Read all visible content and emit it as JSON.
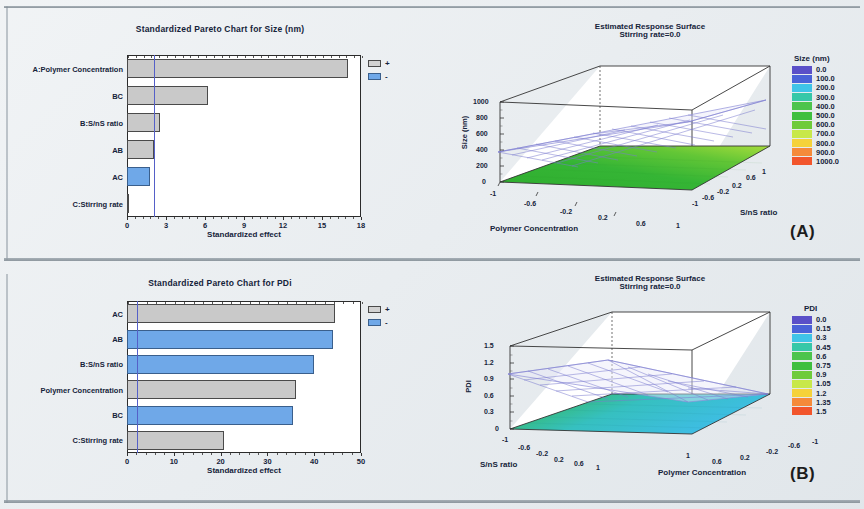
{
  "figure": {
    "panels": [
      {
        "tag": "(A)"
      },
      {
        "tag": "(B)"
      }
    ]
  },
  "panel_a": {
    "tag": "(A)",
    "pareto": {
      "title": "Standardized Pareto Chart for Size (nm)",
      "xtitle": "Standardized effect",
      "legend": {
        "positive": "+",
        "negative": "-"
      }
    },
    "surface": {
      "title_line1": "Estimated Response Surface",
      "title_line2": "Stirring rate=0.0",
      "zlabel": "Size (nm)",
      "xlabel": "Polymer Concentration",
      "ylabel": "S/nS ratio",
      "legend_title": "Size (nm)"
    }
  },
  "panel_b": {
    "tag": "(B)",
    "pareto": {
      "title": "Standardized Pareto Chart for PDi",
      "xtitle": "Standardized effect",
      "legend": {
        "positive": "+",
        "negative": "-"
      }
    },
    "surface": {
      "title_line1": "Estimated Response Surface",
      "title_line2": "Stirring rate=0.0",
      "zlabel": "PDI",
      "xlabel": "Polymer Concentration",
      "ylabel": "S/nS ratio",
      "legend_title": "PDI"
    }
  },
  "chart_data": [
    {
      "type": "bar",
      "id": "pareto-size",
      "orientation": "horizontal",
      "title": "Standardized Pareto Chart for Size (nm)",
      "xlabel": "Standardized effect",
      "ylabel": "",
      "xlim": [
        0,
        18
      ],
      "xticks": [
        0,
        3,
        6,
        9,
        12,
        15,
        18
      ],
      "xticklabels": [
        "0",
        "3",
        "6",
        "9",
        "12",
        "15",
        "18"
      ],
      "grid": false,
      "significance_line": 2.1,
      "categories": [
        "A:Polymer Concentration",
        "BC",
        "B:S/nS ratio",
        "AB",
        "AC",
        "C:Stirring rate"
      ],
      "values": [
        17.0,
        6.2,
        2.5,
        2.1,
        1.75,
        0.05
      ],
      "signs": [
        "+",
        "+",
        "+",
        "+",
        "-",
        "+"
      ],
      "legend": [
        {
          "label": "+",
          "color": "#c9c9c9"
        },
        {
          "label": "-",
          "color": "#6fa8e8"
        }
      ]
    },
    {
      "type": "surface",
      "id": "surface-size",
      "title": "Estimated Response Surface",
      "subtitle": "Stirring rate=0.0",
      "xlabel": "Polymer Concentration",
      "ylabel": "S/nS ratio",
      "zlabel": "Size (nm)",
      "xticks": [
        -1,
        -0.6,
        -0.2,
        0.2,
        0.6,
        1
      ],
      "xticklabels": [
        "-1",
        "-0.6",
        "-0.2",
        "0.2",
        "0.6",
        "1"
      ],
      "yticks": [
        -1,
        -0.6,
        -0.2,
        0.2,
        0.6,
        1
      ],
      "yticklabels": [
        "-1",
        "-0.6",
        "-0.2",
        "0.2",
        "0.6",
        "1"
      ],
      "zticks": [
        0,
        200,
        400,
        600,
        800,
        1000
      ],
      "zticklabels": [
        "0",
        "200",
        "400",
        "600",
        "800",
        "1000"
      ],
      "zlim": [
        0,
        1000
      ],
      "legend_title": "Size (nm)",
      "legend_entries": [
        {
          "value": "0.0",
          "color": "#5a4fc8"
        },
        {
          "value": "100.0",
          "color": "#4a62d8"
        },
        {
          "value": "200.0",
          "color": "#3fc4e8"
        },
        {
          "value": "300.0",
          "color": "#36c8a8"
        },
        {
          "value": "400.0",
          "color": "#4cc44c"
        },
        {
          "value": "500.0",
          "color": "#3fbf3f"
        },
        {
          "value": "600.0",
          "color": "#6ecb3a"
        },
        {
          "value": "700.0",
          "color": "#c8e84a"
        },
        {
          "value": "800.0",
          "color": "#f5d23a"
        },
        {
          "value": "900.0",
          "color": "#f58a3a"
        },
        {
          "value": "1000.0",
          "color": "#f2552c"
        }
      ],
      "surfaces": [
        {
          "name": "response-plane",
          "style": "wireframe",
          "color": "#8f8fd8"
        },
        {
          "name": "floor-contour",
          "style": "filled",
          "color_range": [
            "#2fae2f",
            "#9ed93a"
          ]
        }
      ]
    },
    {
      "type": "bar",
      "id": "pareto-pdi",
      "orientation": "horizontal",
      "title": "Standardized Pareto Chart for PDi",
      "xlabel": "Standardized effect",
      "ylabel": "",
      "xlim": [
        0,
        50
      ],
      "xticks": [
        0,
        10,
        20,
        30,
        40,
        50
      ],
      "xticklabels": [
        "0",
        "10",
        "20",
        "30",
        "40",
        "50"
      ],
      "grid": false,
      "significance_line": 2.1,
      "categories": [
        "AC",
        "AB",
        "B:S/nS ratio",
        "Polymer Concentration",
        "BC",
        "C:Stirring rate"
      ],
      "values": [
        44.5,
        44.0,
        40.0,
        36.2,
        35.5,
        20.8
      ],
      "signs": [
        "+",
        "-",
        "-",
        "+",
        "-",
        "+"
      ],
      "legend": [
        {
          "label": "+",
          "color": "#c9c9c9"
        },
        {
          "label": "-",
          "color": "#6fa8e8"
        }
      ]
    },
    {
      "type": "surface",
      "id": "surface-pdi",
      "title": "Estimated Response Surface",
      "subtitle": "Stirring rate=0.0",
      "xlabel": "Polymer Concentration",
      "ylabel": "S/nS ratio",
      "zlabel": "PDI",
      "xticks": [
        1,
        0.6,
        0.2,
        -0.2,
        -0.6,
        -1
      ],
      "xticklabels": [
        "1",
        "0.6",
        "0.2",
        "-0.2",
        "-0.6",
        "-1"
      ],
      "yticks": [
        -1,
        -0.6,
        -0.2,
        0.2,
        0.6,
        1
      ],
      "yticklabels": [
        "-1",
        "-0.6",
        "-0.2",
        "0.2",
        "0.6",
        "1"
      ],
      "zticks": [
        0,
        0.3,
        0.6,
        0.9,
        1.2,
        1.5
      ],
      "zticklabels": [
        "0",
        "0.3",
        "0.6",
        "0.9",
        "1.2",
        "1.5"
      ],
      "zlim": [
        0,
        1.5
      ],
      "legend_title": "PDI",
      "legend_entries": [
        {
          "value": "0.0",
          "color": "#5a4fc8"
        },
        {
          "value": "0.15",
          "color": "#4a62d8"
        },
        {
          "value": "0.3",
          "color": "#3fc4e8"
        },
        {
          "value": "0.45",
          "color": "#36c8a8"
        },
        {
          "value": "0.6",
          "color": "#4cc44c"
        },
        {
          "value": "0.75",
          "color": "#3fbf3f"
        },
        {
          "value": "0.9",
          "color": "#6ecb3a"
        },
        {
          "value": "1.05",
          "color": "#c8e84a"
        },
        {
          "value": "1.2",
          "color": "#f5d23a"
        },
        {
          "value": "1.35",
          "color": "#f58a3a"
        },
        {
          "value": "1.5",
          "color": "#f2552c"
        }
      ],
      "surfaces": [
        {
          "name": "response-plane",
          "style": "wireframe",
          "color": "#8f8fd8"
        },
        {
          "name": "floor-contour",
          "style": "filled",
          "color_range": [
            "#2fae2f",
            "#3fc4e8"
          ]
        }
      ]
    }
  ]
}
